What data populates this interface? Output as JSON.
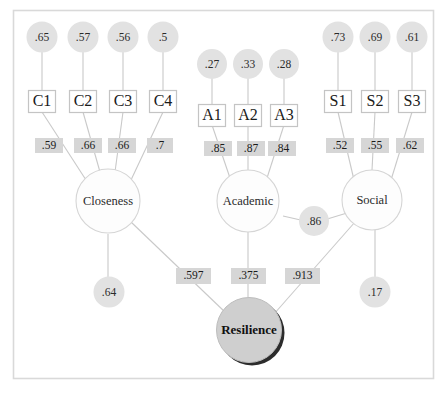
{
  "diagram": {
    "type": "sem-path-diagram",
    "frame": {
      "stroke_color": "#d9d9d9"
    },
    "colors": {
      "error_circle_fill": "#e2e2e2",
      "loading_label_fill": "#d6d6d6",
      "latent_circle_fill": "#fdfdfd",
      "latent_circle_stroke": "#d5d5d5",
      "resilience_fill": "#cfcfcf",
      "path_line": "#c9c9c9",
      "text": "#1d1d1d"
    },
    "error_terms": [
      {
        "id": "e-c1",
        "label": ".65"
      },
      {
        "id": "e-c2",
        "label": ".57"
      },
      {
        "id": "e-c3",
        "label": ".56"
      },
      {
        "id": "e-c4",
        "label": ".5"
      },
      {
        "id": "e-a1",
        "label": ".27"
      },
      {
        "id": "e-a2",
        "label": ".33"
      },
      {
        "id": "e-a3",
        "label": ".28"
      },
      {
        "id": "e-s1",
        "label": ".73"
      },
      {
        "id": "e-s2",
        "label": ".69"
      },
      {
        "id": "e-s3",
        "label": ".61"
      }
    ],
    "observed_variables": [
      {
        "id": "c1",
        "label": "C1"
      },
      {
        "id": "c2",
        "label": "C2"
      },
      {
        "id": "c3",
        "label": "C3"
      },
      {
        "id": "c4",
        "label": "C4"
      },
      {
        "id": "a1",
        "label": "A1"
      },
      {
        "id": "a2",
        "label": "A2"
      },
      {
        "id": "a3",
        "label": "A3"
      },
      {
        "id": "s1",
        "label": "S1"
      },
      {
        "id": "s2",
        "label": "S2"
      },
      {
        "id": "s3",
        "label": "S3"
      }
    ],
    "factor_loadings": [
      {
        "id": "load-c1",
        "label": ".59"
      },
      {
        "id": "load-c2",
        "label": ".66"
      },
      {
        "id": "load-c3",
        "label": ".66"
      },
      {
        "id": "load-c4",
        "label": ".7"
      },
      {
        "id": "load-a1",
        "label": ".85"
      },
      {
        "id": "load-a2",
        "label": ".87"
      },
      {
        "id": "load-a3",
        "label": ".84"
      },
      {
        "id": "load-s1",
        "label": ".52"
      },
      {
        "id": "load-s2",
        "label": ".55"
      },
      {
        "id": "load-s3",
        "label": ".62"
      }
    ],
    "latent_factors": [
      {
        "id": "closeness",
        "label": "Closeness"
      },
      {
        "id": "academic",
        "label": "Academic"
      },
      {
        "id": "social",
        "label": "Social"
      }
    ],
    "outcome": {
      "id": "resilience",
      "label": "Resilience"
    },
    "structural_paths": [
      {
        "id": "path-closeness-resilience",
        "label": ".597",
        "from": "Closeness",
        "to": "Resilience"
      },
      {
        "id": "path-academic-resilience",
        "label": ".375",
        "from": "Academic",
        "to": "Resilience"
      },
      {
        "id": "path-social-resilience",
        "label": ".913",
        "from": "Social",
        "to": "Resilience"
      }
    ],
    "disturbances": [
      {
        "id": "d-closeness",
        "label": ".64"
      },
      {
        "id": "d-social",
        "label": ".17"
      }
    ],
    "covariances": [
      {
        "id": "cov-academic-social",
        "label": ".86"
      }
    ]
  }
}
